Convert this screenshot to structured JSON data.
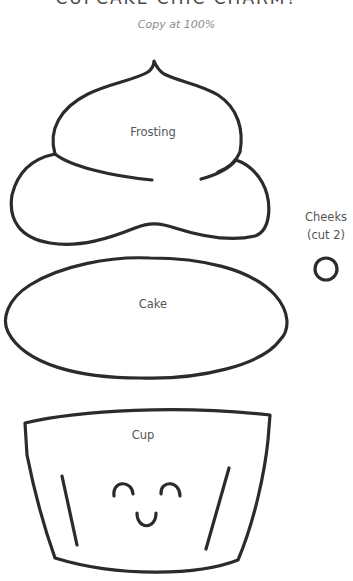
{
  "header": {
    "title": "CUPCAKE CHIC CHARM?",
    "subtitle": "Copy at 100%"
  },
  "pieces": {
    "frosting": {
      "label": "Frosting"
    },
    "cake": {
      "label": "Cake"
    },
    "cup": {
      "label": "Cup"
    },
    "cheeks": {
      "label_line1": "Cheeks",
      "label_line2": "(cut 2)"
    }
  },
  "colors": {
    "outline": "#2b2b2b",
    "label_text": "#555555",
    "subtitle_text": "#8a8a8a",
    "background": "#ffffff"
  }
}
